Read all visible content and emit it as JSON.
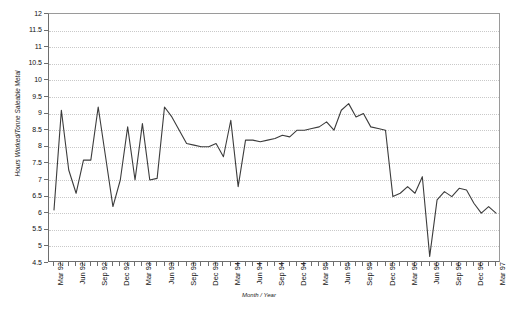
{
  "chart_data": {
    "type": "line",
    "title": "Hours Worked / Tonne Saleable Metal",
    "xlabel": "Month / Year",
    "ylabel": "Hours Worked/Tonne Saleable Metal",
    "ylim": [
      4.5,
      12
    ],
    "ytick_labels": [
      "12",
      "11.5",
      "11",
      "10.5",
      "10",
      "9.5",
      "9",
      "8.5",
      "8",
      "7.5",
      "7",
      "6.5",
      "6",
      "5.5",
      "5",
      "4.5"
    ],
    "ytick_values": [
      12,
      11.5,
      11,
      10.5,
      10,
      9.5,
      9,
      8.5,
      8,
      7.5,
      7,
      6.5,
      6,
      5.5,
      5,
      4.5
    ],
    "grid": "horizontal-dotted",
    "legend": "none",
    "line_color": "#3c3c3c",
    "xtick_labels": [
      "Mar 92",
      "Jun 92",
      "Sep 92",
      "Dec 92",
      "Mar 93",
      "Jun 93",
      "Sep 93",
      "Dec 93",
      "Mar 94",
      "Jun 94",
      "Sep 94",
      "Dec 94",
      "Mar 95",
      "Jun 95",
      "Sep 95",
      "Dec 95",
      "Mar 96",
      "Jun 96",
      "Sep 96",
      "Dec 96",
      "Mar 97"
    ],
    "xtick_interval_months": 3,
    "x_start": "Mar 92",
    "x_end": "Mar 97",
    "x": [
      "Mar 92",
      "Apr 92",
      "May 92",
      "Jun 92",
      "Jul 92",
      "Aug 92",
      "Sep 92",
      "Oct 92",
      "Nov 92",
      "Dec 92",
      "Jan 93",
      "Feb 93",
      "Mar 93",
      "Apr 93",
      "May 93",
      "Jun 93",
      "Jul 93",
      "Aug 93",
      "Sep 93",
      "Oct 93",
      "Nov 93",
      "Dec 93",
      "Jan 94",
      "Feb 94",
      "Mar 94",
      "Apr 94",
      "May 94",
      "Jun 94",
      "Jul 94",
      "Aug 94",
      "Sep 94",
      "Oct 94",
      "Nov 94",
      "Dec 94",
      "Jan 95",
      "Feb 95",
      "Mar 95",
      "Apr 95",
      "May 95",
      "Jun 95",
      "Jul 95",
      "Aug 95",
      "Sep 95",
      "Oct 95",
      "Nov 95",
      "Dec 95",
      "Jan 96",
      "Feb 96",
      "Mar 96",
      "Apr 96",
      "May 96",
      "Jun 96",
      "Jul 96",
      "Aug 96",
      "Sep 96",
      "Oct 96",
      "Nov 96",
      "Dec 96",
      "Jan 97",
      "Feb 97",
      "Mar 97"
    ],
    "values": [
      6.1,
      9.1,
      7.3,
      6.6,
      7.6,
      7.6,
      9.2,
      7.7,
      6.2,
      7.0,
      8.6,
      7.0,
      8.7,
      7.0,
      7.05,
      9.2,
      8.9,
      8.5,
      8.1,
      8.05,
      8.0,
      8.0,
      8.1,
      7.7,
      8.8,
      6.8,
      8.2,
      8.2,
      8.15,
      8.2,
      8.25,
      8.35,
      8.3,
      8.5,
      8.5,
      8.55,
      8.6,
      8.75,
      8.5,
      9.1,
      9.3,
      8.9,
      9.0,
      8.6,
      8.55,
      8.5,
      6.5,
      6.6,
      6.8,
      6.6,
      7.1,
      4.7,
      6.4,
      6.65,
      6.5,
      6.75,
      6.7,
      6.3,
      6.0,
      6.2,
      6.0
    ]
  }
}
